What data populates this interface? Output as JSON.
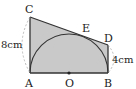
{
  "diagram": {
    "type": "geometry",
    "points": {
      "A": {
        "label": "A",
        "x": 30,
        "y": 73
      },
      "B": {
        "label": "B",
        "x": 108,
        "y": 73
      },
      "C": {
        "label": "C",
        "x": 30,
        "y": 17
      },
      "D": {
        "label": "D",
        "x": 108,
        "y": 45
      },
      "E": {
        "label": "E",
        "x": 78,
        "y": 33
      },
      "O": {
        "label": "O",
        "x": 69,
        "y": 73
      }
    },
    "measures": {
      "AC": "8cm",
      "BD": "4cm"
    },
    "colors": {
      "fill": "#c9c9c9",
      "stroke": "#333333",
      "dashed": "#aaaaaa"
    }
  }
}
